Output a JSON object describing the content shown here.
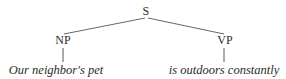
{
  "figure": {
    "kind": "syntax-tree",
    "width": 286,
    "height": 79,
    "background_color": "#ffffff",
    "ink_color": "#2b2b2b",
    "line_color": "#555555"
  },
  "tree": {
    "root": {
      "label": "S",
      "x": 146,
      "y": 15
    },
    "constituents": [
      {
        "label": "NP",
        "x": 63,
        "y": 44,
        "leaf": {
          "text": "Our neighbor's pet",
          "x": 56,
          "y": 76,
          "style": "italic"
        }
      },
      {
        "label": "VP",
        "x": 225,
        "y": 44,
        "leaf": {
          "text": "is outdoors constantly",
          "x": 224,
          "y": 76,
          "style": "italic"
        }
      }
    ],
    "edges": [
      {
        "name": "s-to-np",
        "x1": 145,
        "y1": 18,
        "x2": 64,
        "y2": 34
      },
      {
        "name": "s-to-vp",
        "x1": 148,
        "y1": 18,
        "x2": 224,
        "y2": 34
      },
      {
        "name": "np-to-leaf",
        "x1": 63,
        "y1": 48,
        "x2": 63,
        "y2": 62
      },
      {
        "name": "vp-to-leaf",
        "x1": 224,
        "y1": 48,
        "x2": 224,
        "y2": 62
      }
    ]
  }
}
